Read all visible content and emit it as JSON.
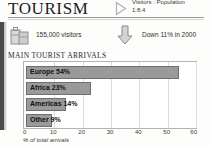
{
  "header": {
    "title": "TOURISM",
    "marker_icon": "triangle-right-icon",
    "ratio_line1": "Visitors : Population",
    "ratio_line2": "1:8.4"
  },
  "stats": [
    {
      "icon": "luggage-icon",
      "text": "155,000 visitors"
    },
    {
      "icon": "arrow-down-icon",
      "text": "Down 11% in 2000"
    }
  ],
  "chart_data": {
    "type": "bar",
    "orientation": "horizontal",
    "title": "MAIN TOURIST ARRIVALS",
    "categories": [
      "Europe",
      "Africa",
      "Americas",
      "Other"
    ],
    "values": [
      54,
      23,
      14,
      9
    ],
    "bar_labels": [
      "Europe 54%",
      "Africa 23%",
      "Americas 14%",
      "Other 9%"
    ],
    "xlabel": "% of total arrivals",
    "ylabel": "",
    "xlim": [
      0,
      60
    ],
    "xticks": [
      0,
      10,
      20,
      30,
      40,
      50,
      60
    ],
    "xtick_labels": [
      "0",
      "10",
      "20",
      "30",
      "40",
      "50",
      "60"
    ],
    "grid": true,
    "legend": "none",
    "bar_color": "#9a9a9a",
    "bar_border_color": "#6f6f6f"
  }
}
